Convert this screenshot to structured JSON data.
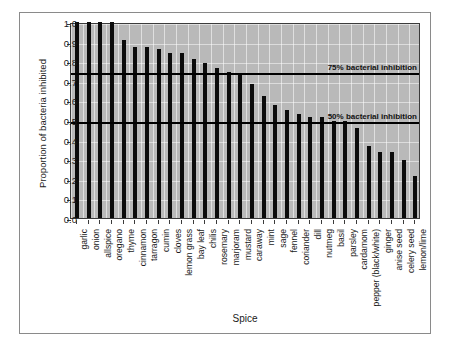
{
  "chart_data": {
    "type": "bar",
    "title": "",
    "xlabel": "Spice",
    "ylabel": "Proportion of bacteria inhibited",
    "ylim": [
      0.0,
      1.0
    ],
    "ytick_labels": [
      "1.0",
      "0.9",
      "0.8",
      "0.7",
      "0.6",
      "0.5",
      "0.4",
      "0.3",
      "0.2",
      "0.1",
      "0.0"
    ],
    "ytick_values": [
      1.0,
      0.9,
      0.8,
      0.7,
      0.6,
      0.5,
      0.4,
      0.3,
      0.2,
      0.1,
      0.0
    ],
    "grid": true,
    "legend": "none",
    "bar_color": "#0b0b0b",
    "plot_background": "#b9b9b9",
    "categories": [
      "garlic",
      "onion",
      "allspice",
      "oregano",
      "thyme",
      "cinnamon",
      "tarragon",
      "cumin",
      "cloves",
      "lemon grass",
      "bay leaf",
      "chilis",
      "rosemary",
      "marjoram",
      "mustard",
      "caraway",
      "mint",
      "sage",
      "fennel",
      "coriander",
      "dill",
      "nutmeg",
      "basil",
      "parsley",
      "cardamom",
      "pepper (black/white)",
      "ginger",
      "anise seed",
      "celery seed",
      "lemon/lime"
    ],
    "values": [
      1.0,
      1.0,
      1.0,
      1.0,
      0.91,
      0.87,
      0.87,
      0.86,
      0.84,
      0.84,
      0.81,
      0.79,
      0.765,
      0.745,
      0.74,
      0.685,
      0.62,
      0.575,
      0.55,
      0.53,
      0.515,
      0.515,
      0.495,
      0.495,
      0.46,
      0.365,
      0.335,
      0.335,
      0.295,
      0.215
    ],
    "reference_lines": [
      {
        "value": 0.75,
        "label": "75% bacterial inhibition"
      },
      {
        "value": 0.5,
        "label": "50% bacterial inhibition"
      }
    ]
  }
}
